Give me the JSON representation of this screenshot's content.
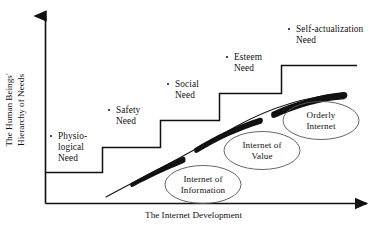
{
  "figure": {
    "type": "conceptual-diagram",
    "title_visible": false,
    "background_color": "#ffffff",
    "line_color": "#111111",
    "axes": {
      "y_axis_title": "The Human Beings'\nHierarchy of Needs",
      "x_axis_title": "The Internet Development",
      "y_axis_has_arrow": true,
      "x_axis_has_arrow": true
    },
    "steps": [
      {
        "id": "physiological",
        "label": "Physio-\nlogical\nNeed",
        "level": 1,
        "bullet": true
      },
      {
        "id": "safety",
        "label": "Safety\nNeed",
        "level": 2,
        "bullet": true
      },
      {
        "id": "social",
        "label": "Social\nNeed",
        "level": 3,
        "bullet": true
      },
      {
        "id": "esteem",
        "label": "Esteem\nNeed",
        "level": 4,
        "bullet": true
      },
      {
        "id": "self-actualization",
        "label": "Self-actualization\nNeed",
        "level": 5,
        "bullet": true
      }
    ],
    "ellipses": [
      {
        "id": "internet-of-information",
        "label": "Internet of\nInformation",
        "order": 1
      },
      {
        "id": "internet-of-value",
        "label": "Internet of\nValue",
        "order": 2
      },
      {
        "id": "orderly-internet",
        "label": "Orderly\nInternet",
        "order": 3
      }
    ],
    "curve": {
      "description": "rising growth curve with three thickened tapered segments",
      "segments": 3,
      "style": "monotonic increasing, concave down"
    }
  }
}
